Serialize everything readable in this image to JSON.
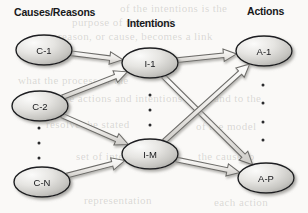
{
  "figure": {
    "title_columns": [
      {
        "label": "Causes/Reasons",
        "x": 14,
        "y": 6
      },
      {
        "label": "Intentions",
        "x": 127,
        "y": 17
      },
      {
        "label": "Actions",
        "x": 247,
        "y": 5
      }
    ],
    "nodes": [
      {
        "id": "c1",
        "label": "C-1",
        "cx": 44,
        "cy": 50,
        "rx": 28,
        "ry": 15,
        "column": "causes"
      },
      {
        "id": "c2",
        "label": "C-2",
        "cx": 40,
        "cy": 106,
        "rx": 28,
        "ry": 15,
        "column": "causes"
      },
      {
        "id": "cn",
        "label": "C-N",
        "cx": 42,
        "cy": 182,
        "rx": 28,
        "ry": 15,
        "column": "causes"
      },
      {
        "id": "i1",
        "label": "I-1",
        "cx": 150,
        "cy": 63,
        "rx": 28,
        "ry": 15,
        "column": "intentions"
      },
      {
        "id": "im",
        "label": "I-M",
        "cx": 150,
        "cy": 154,
        "rx": 28,
        "ry": 15,
        "column": "intentions"
      },
      {
        "id": "a1",
        "label": "A-1",
        "cx": 264,
        "cy": 51,
        "rx": 28,
        "ry": 15,
        "column": "actions"
      },
      {
        "id": "ap",
        "label": "A-P",
        "cx": 266,
        "cy": 178,
        "rx": 28,
        "ry": 15,
        "column": "actions"
      }
    ],
    "edges": [
      {
        "from": "c1",
        "to": "i1"
      },
      {
        "from": "c2",
        "to": "i1"
      },
      {
        "from": "c2",
        "to": "im"
      },
      {
        "from": "cn",
        "to": "im"
      },
      {
        "from": "i1",
        "to": "a1"
      },
      {
        "from": "i1",
        "to": "ap"
      },
      {
        "from": "im",
        "to": "a1"
      },
      {
        "from": "im",
        "to": "ap"
      }
    ],
    "ellipsis_groups": [
      {
        "name": "causes-ellipsis",
        "x": 39,
        "ys": [
          128,
          143,
          158
        ]
      },
      {
        "name": "intentions-ellipsis",
        "x": 150,
        "ys": [
          95,
          110,
          125
        ]
      },
      {
        "name": "actions-ellipsis",
        "x": 263,
        "ys": [
          85,
          103,
          122,
          140
        ]
      }
    ],
    "colors": {
      "node_fill_light": "#f2f1ef",
      "node_fill_dark": "#b9b8b4",
      "node_stroke": "#1d1e20",
      "arrow_fill": "#efeeec",
      "arrow_stroke": "#6d6c69",
      "shadow": "#9b9a96",
      "text": "#16171a",
      "background": "#faf9f7"
    }
  },
  "background_text": [
    {
      "t": "of the intentions is the",
      "x": 120,
      "y": 2
    },
    {
      "t": "purpose of the stated",
      "x": 72,
      "y": 16
    },
    {
      "t": "reason, or cause, becomes a link",
      "x": 58,
      "y": 30
    },
    {
      "t": "what the process of the",
      "x": 18,
      "y": 74
    },
    {
      "t": "the actions and intentions",
      "x": 60,
      "y": 92
    },
    {
      "t": "and to the",
      "x": 214,
      "y": 92
    },
    {
      "t": "resolve the stated",
      "x": 46,
      "y": 118
    },
    {
      "t": "of the model",
      "x": 196,
      "y": 120
    },
    {
      "t": "set of intentions",
      "x": 76,
      "y": 150
    },
    {
      "t": "the cause to",
      "x": 198,
      "y": 150
    },
    {
      "t": "representation",
      "x": 84,
      "y": 194
    },
    {
      "t": "each action",
      "x": 214,
      "y": 196
    }
  ]
}
